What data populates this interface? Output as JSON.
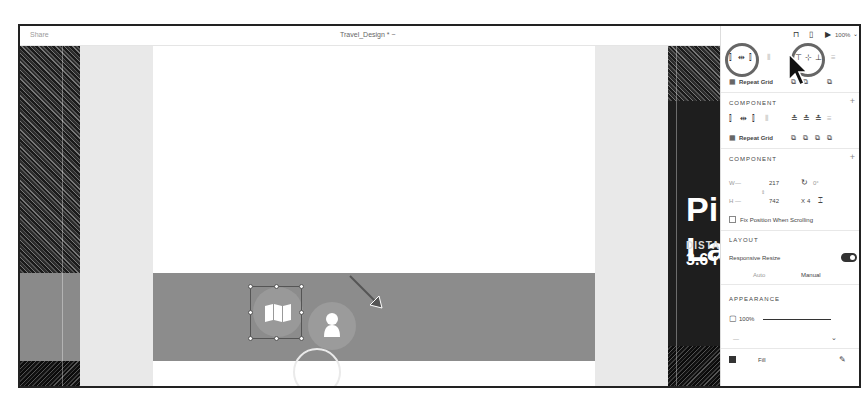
{
  "window": {
    "share_label": "Share",
    "document_title": "Travel_Design * ~"
  },
  "canvas": {
    "hero": {
      "title_line1": "Pi",
      "title_line2": "La",
      "distance_label": "DISTA",
      "distance_value": "3.6 r"
    },
    "navbar": {
      "selected_icon": "map-icon",
      "secondary_icon": "user-icon"
    }
  },
  "panel": {
    "topbar": {
      "zoom": "100%",
      "icons": [
        "share-link-icon",
        "device-preview-icon",
        "play-icon",
        "chevron-down-icon"
      ]
    },
    "repeat_grid_label": "Repeat Grid",
    "component_label": "COMPONENT",
    "component_label_2": "COMPONENT",
    "transform": {
      "w_label": "W",
      "w_value": "217",
      "h_label": "H",
      "h_value": "742",
      "rotation": "0°",
      "x_label": "X",
      "x_value": "4",
      "lock_icon": "lock-aspect-icon"
    },
    "fix_position_label": "Fix Position When Scrolling",
    "layout_label": "LAYOUT",
    "responsive_resize_label": "Responsive Resize",
    "responsive_resize_on": true,
    "resize_modes": {
      "auto": "Auto",
      "manual": "Manual"
    },
    "appearance_label": "APPEARANCE",
    "opacity_value": "100%",
    "blend_value": "—",
    "fill_label": "Fill"
  }
}
